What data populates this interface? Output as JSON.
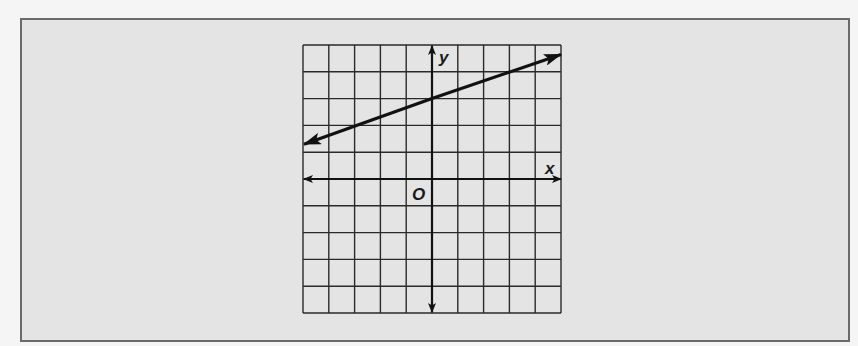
{
  "chart_data": {
    "type": "line",
    "title": "",
    "xlabel": "x",
    "ylabel": "y",
    "origin_label": "O",
    "xlim": [
      -5,
      5
    ],
    "ylim": [
      -5,
      5
    ],
    "grid": true,
    "grid_step": 1,
    "tick_labels": false,
    "series": [
      {
        "name": "line",
        "equation": "y = (1/3)x + 3",
        "slope": 0.3333,
        "y_intercept": 3,
        "x": [
          -5,
          -3,
          0,
          3,
          5
        ],
        "y": [
          1.33,
          2,
          3,
          4,
          4.67
        ],
        "arrows": "both"
      }
    ],
    "colors": {
      "line": "#111111",
      "grid": "#2a2a2a",
      "background": "#e4e4e4"
    }
  }
}
